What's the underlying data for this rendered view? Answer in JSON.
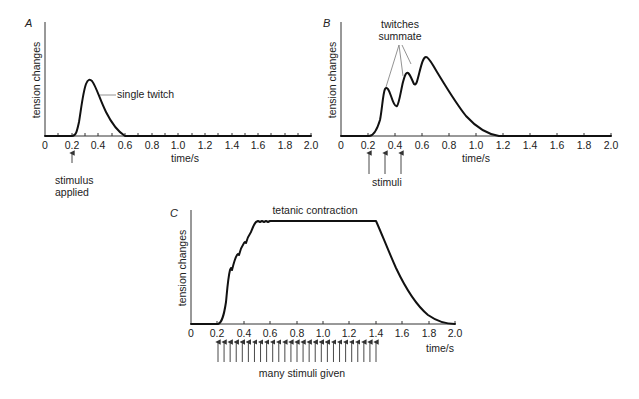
{
  "chart_data": [
    {
      "type": "line",
      "panel": "A",
      "title": "",
      "xlabel": "time/s",
      "ylabel": "tension changes",
      "xlim": [
        0,
        2.0
      ],
      "x_ticks": [
        "0",
        "0.2",
        "0.4",
        "0.6",
        "0.8",
        "1.0",
        "1.2",
        "1.4",
        "1.6",
        "1.8",
        "2.0"
      ],
      "grid": false,
      "annotations": [
        "single twitch",
        "stimulus applied"
      ],
      "stimuli_times": [
        0.2
      ],
      "series": [
        {
          "name": "single twitch",
          "x": [
            0,
            0.2,
            0.22,
            0.25,
            0.28,
            0.32,
            0.36,
            0.42,
            0.48,
            0.55,
            0.6,
            2.0
          ],
          "y": [
            0,
            0,
            0.05,
            0.35,
            0.85,
            1.0,
            0.9,
            0.6,
            0.3,
            0.07,
            0,
            0
          ]
        }
      ]
    },
    {
      "type": "line",
      "panel": "B",
      "title": "",
      "xlabel": "time/s",
      "ylabel": "tension changes",
      "xlim": [
        0,
        2.0
      ],
      "x_ticks": [
        "0",
        "0.2",
        "0.4",
        "0.6",
        "0.8",
        "1.0",
        "1.2",
        "1.4",
        "1.6",
        "1.8",
        "2.0"
      ],
      "grid": false,
      "annotations": [
        "twitches summate",
        "stimuli"
      ],
      "stimuli_times": [
        0.2,
        0.31,
        0.44
      ],
      "series": [
        {
          "name": "summated twitches",
          "x": [
            0,
            0.22,
            0.27,
            0.3,
            0.34,
            0.38,
            0.41,
            0.44,
            0.47,
            0.5,
            0.53,
            0.56,
            0.6,
            0.7,
            0.8,
            0.9,
            1.0,
            1.1,
            2.0
          ],
          "y": [
            0,
            0,
            0.4,
            0.9,
            0.65,
            0.55,
            0.85,
            1.2,
            1.1,
            1.0,
            1.3,
            1.45,
            1.35,
            1.0,
            0.65,
            0.35,
            0.12,
            0,
            0
          ]
        }
      ]
    },
    {
      "type": "line",
      "panel": "C",
      "title": "tetanic contraction",
      "xlabel": "time/s",
      "ylabel": "tension changes",
      "xlim": [
        0,
        2.0
      ],
      "x_ticks": [
        "0",
        "0.2",
        "0.4",
        "0.6",
        "0.8",
        "1.0",
        "1.2",
        "1.4",
        "1.6",
        "1.8",
        "2.0"
      ],
      "grid": false,
      "annotations": [
        "tetanic contraction",
        "many stimuli given"
      ],
      "stimuli_times": "27 evenly spaced stimuli from 0.2 to 1.4 s",
      "series": [
        {
          "name": "tetanic contraction",
          "x": [
            0,
            0.2,
            0.24,
            0.27,
            0.3,
            0.34,
            0.38,
            0.42,
            0.46,
            0.5,
            1.0,
            1.42,
            1.5,
            1.6,
            1.7,
            1.8,
            1.9,
            2.0
          ],
          "y": [
            0,
            0,
            0.15,
            0.5,
            0.6,
            0.75,
            0.85,
            0.92,
            1.0,
            1.0,
            1.0,
            1.0,
            0.75,
            0.5,
            0.3,
            0.14,
            0.04,
            0
          ]
        }
      ]
    }
  ],
  "labels": {
    "panel_a": "A",
    "panel_b": "B",
    "panel_c": "C",
    "ylabel": "tension changes",
    "xlabel": "time/s",
    "single_twitch": "single twitch",
    "stimulus": "stimulus",
    "applied": "applied",
    "twitches": "twitches",
    "summate": "summate",
    "stimuli": "stimuli",
    "tetanic": "tetanic contraction",
    "many_stimuli": "many stimuli given"
  },
  "ticks": [
    "0",
    "0.2",
    "0.4",
    "0.6",
    "0.8",
    "1.0",
    "1.2",
    "1.4",
    "1.6",
    "1.8",
    "2.0"
  ]
}
